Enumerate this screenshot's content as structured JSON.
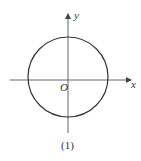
{
  "figure": {
    "x_axis_label": "x",
    "y_axis_label": "y",
    "origin_label": "O",
    "caption": "(1)",
    "shape": "circle centered at origin",
    "colors": {
      "stroke": "#333333",
      "axis": "#555555",
      "background": "#ffffff"
    }
  }
}
